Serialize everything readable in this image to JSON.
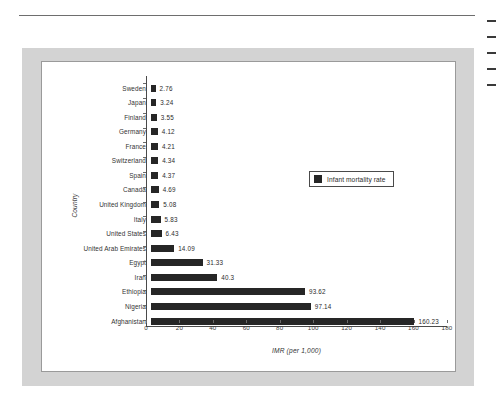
{
  "page": {
    "rule": "horizontal-rule",
    "margin_text_lines": 5
  },
  "legend": {
    "label": "Infant mortality rate",
    "swatch_color": "#262626",
    "position": "top-right-inside"
  },
  "axes": {
    "y_title": "Country",
    "x_title": "IMR (per 1,000)"
  },
  "chart_data": {
    "type": "bar",
    "orientation": "horizontal",
    "title": "",
    "subtitle": "",
    "xlabel": "IMR (per 1,000)",
    "ylabel": "Country",
    "xlim": [
      0,
      180
    ],
    "xticks": [
      0,
      20,
      40,
      60,
      80,
      100,
      120,
      140,
      160,
      180
    ],
    "grid": false,
    "legend": [
      "Infant mortality rate"
    ],
    "legend_position": "upper right",
    "bar_color": "#262626",
    "value_labels": true,
    "categories": [
      "Sweden",
      "Japan",
      "Finland",
      "Germany",
      "France",
      "Switzerland",
      "Spain",
      "Canada",
      "United Kingdom",
      "Italy",
      "United States",
      "United Arab Emirates",
      "Egypt",
      "Iran",
      "Ethiopia",
      "Nigeria",
      "Afghanistan"
    ],
    "values": [
      2.76,
      3.24,
      3.55,
      4.12,
      4.21,
      4.34,
      4.37,
      4.69,
      5.08,
      5.83,
      6.43,
      14.09,
      31.33,
      40.3,
      93.62,
      97.14,
      160.23
    ],
    "value_label_text": [
      "2.76",
      "3.24",
      "3.55",
      "4.12",
      "4.21",
      "4.34",
      "4.37",
      "4.69",
      "5.08",
      "5.83",
      "6.43",
      "14.09",
      "31.33",
      "40.3",
      "93.62",
      "97.14",
      "160.23"
    ]
  }
}
